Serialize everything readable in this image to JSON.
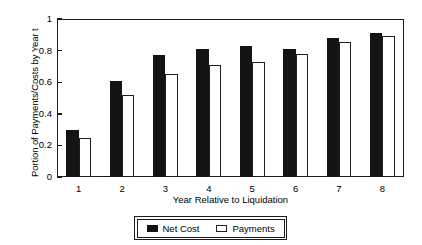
{
  "chart_data": {
    "type": "bar",
    "title": "",
    "subtitle": "",
    "xlabel": "Year Relative to Liquidation",
    "ylabel": "Portion of Payments/Costs by Year t",
    "categories": [
      "1",
      "2",
      "3",
      "4",
      "5",
      "6",
      "7",
      "8"
    ],
    "ylim": [
      0,
      1
    ],
    "yticks": [
      "0",
      "0.2",
      "0.4",
      "0.6",
      "0.8",
      "1"
    ],
    "ytick_values": [
      0,
      0.2,
      0.4,
      0.6,
      0.8,
      1
    ],
    "grid": false,
    "legend_position": "bottom-center",
    "series": [
      {
        "name": "Net Cost",
        "style": "filled",
        "color": "#141414",
        "values": [
          0.3,
          0.61,
          0.77,
          0.81,
          0.83,
          0.81,
          0.88,
          0.91
        ]
      },
      {
        "name": "Payments",
        "style": "hollow",
        "color": "#ffffff",
        "edge_color": "#1f1f1f",
        "values": [
          0.25,
          0.52,
          0.655,
          0.71,
          0.73,
          0.78,
          0.855,
          0.89
        ]
      }
    ]
  },
  "legend": {
    "entries": [
      {
        "label": "Net Cost",
        "swatch": "filled-square-icon"
      },
      {
        "label": "Payments",
        "swatch": "hollow-square-icon"
      }
    ]
  },
  "colors": {
    "axis": "#1b1b1b",
    "net_cost": "#141414",
    "payments_fill": "#ffffff",
    "payments_edge": "#1f1f1f",
    "background": "#ffffff"
  }
}
